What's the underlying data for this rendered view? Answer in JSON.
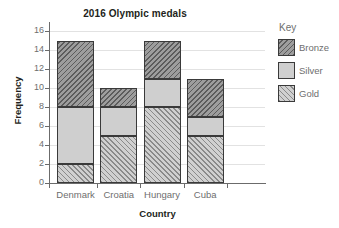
{
  "chart_data": {
    "type": "bar",
    "subtype": "stacked-bar",
    "title": "2016 Olympic medals",
    "xlabel": "Country",
    "ylabel": "Frequency",
    "categories": [
      "Denmark",
      "Croatia",
      "Hungary",
      "Cuba"
    ],
    "series": [
      {
        "name": "Gold",
        "values": [
          2,
          5,
          8,
          5
        ]
      },
      {
        "name": "Silver",
        "values": [
          6,
          3,
          3,
          2
        ]
      },
      {
        "name": "Bronze",
        "values": [
          7,
          2,
          4,
          4
        ]
      }
    ],
    "totals": [
      15,
      10,
      15,
      11
    ],
    "stack_boundaries": {
      "Denmark": {
        "gold": [
          0,
          2
        ],
        "silver": [
          2,
          8
        ],
        "bronze": [
          8,
          15
        ]
      },
      "Croatia": {
        "gold": [
          0,
          5
        ],
        "silver": [
          5,
          8
        ],
        "bronze": [
          8,
          10
        ]
      },
      "Hungary": {
        "gold": [
          0,
          8
        ],
        "silver": [
          8,
          11
        ],
        "bronze": [
          11,
          15
        ]
      },
      "Cuba": {
        "gold": [
          0,
          5
        ],
        "silver": [
          5,
          7
        ],
        "bronze": [
          7,
          11
        ]
      }
    },
    "ylim": [
      0,
      17
    ],
    "yticks": [
      0,
      2,
      4,
      6,
      8,
      10,
      12,
      14,
      16
    ],
    "ytick_labels": [
      "0",
      "2",
      "4",
      "6",
      "8",
      "10",
      "12",
      "14",
      "16"
    ],
    "grid": "horizontal",
    "legend_position": "right",
    "legend_title": "Key",
    "legend_entries": [
      {
        "label": "Bronze",
        "pattern": "diagonal-hatch-backslash",
        "color": "#9d9d9d"
      },
      {
        "label": "Silver",
        "pattern": "solid",
        "color": "#cfcfcf"
      },
      {
        "label": "Gold",
        "pattern": "diagonal-hatch-forwardslash",
        "color": "#d0d0d0"
      }
    ]
  },
  "colors": {
    "title_text": "#231f20",
    "tick_text": "#6e6e6e",
    "axis_line": "#6b6b6b",
    "gridline": "#e2e2e2",
    "bar_outline": "#3a3a3a",
    "background": "#ffffff"
  }
}
